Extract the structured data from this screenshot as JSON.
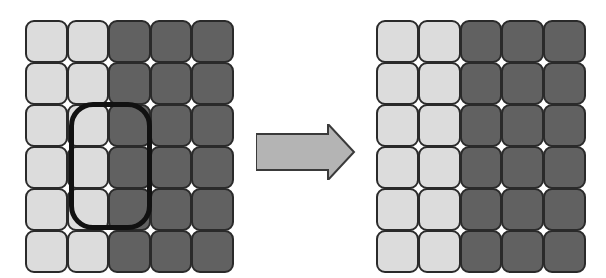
{
  "diagram": {
    "colors": {
      "light": "#dcdcdc",
      "dark": "#616161",
      "outline": "#2a2a2a",
      "selection": "#111111",
      "arrow_fill": "#b4b4b4",
      "arrow_stroke": "#3a3a3a"
    },
    "before": {
      "rows": 6,
      "cols": 5,
      "cells": [
        [
          "light",
          "light",
          "dark",
          "dark",
          "dark"
        ],
        [
          "light",
          "light",
          "dark",
          "dark",
          "dark"
        ],
        [
          "light",
          "light",
          "dark",
          "dark",
          "dark"
        ],
        [
          "light",
          "light",
          "dark",
          "dark",
          "dark"
        ],
        [
          "light",
          "light",
          "dark",
          "dark",
          "dark"
        ],
        [
          "light",
          "light",
          "dark",
          "dark",
          "dark"
        ]
      ],
      "selection": {
        "row_start": 2,
        "row_end": 4,
        "col_start": 1,
        "col_end": 3
      }
    },
    "transition": {
      "icon": "right-arrow-icon"
    },
    "after": {
      "rows": 6,
      "cols": 5,
      "cells": [
        [
          "light",
          "light",
          "dark",
          "dark",
          "dark"
        ],
        [
          "light",
          "light",
          "dark",
          "dark",
          "dark"
        ],
        [
          "light",
          "light",
          "dark",
          "dark",
          "dark"
        ],
        [
          "light",
          "light",
          "dark",
          "dark",
          "dark"
        ],
        [
          "light",
          "light",
          "dark",
          "dark",
          "dark"
        ],
        [
          "light",
          "light",
          "dark",
          "dark",
          "dark"
        ]
      ]
    }
  }
}
